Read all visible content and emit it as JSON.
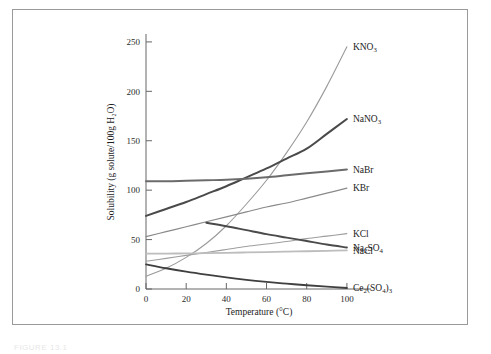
{
  "figure": {
    "caption_partial": "FIGURE 13.1"
  },
  "chart_data": {
    "type": "line",
    "title": "",
    "xlabel": "Temperature (°C)",
    "ylabel": "Solubility (g solute/100g H₂O)",
    "xlim": [
      0,
      112
    ],
    "ylim": [
      0,
      258
    ],
    "xticks": [
      0,
      20,
      40,
      60,
      80,
      100
    ],
    "xtick_labels": [
      "0",
      "20",
      "40",
      "60",
      "80",
      "100"
    ],
    "yticks": [
      0,
      50,
      100,
      150,
      200,
      250
    ],
    "ytick_labels": [
      "0",
      "50",
      "100",
      "150",
      "200",
      "250"
    ],
    "grid": false,
    "legend_position": "right-inline-labels",
    "x": [
      0,
      10,
      20,
      30,
      40,
      50,
      60,
      70,
      80,
      90,
      100
    ],
    "series": [
      {
        "name": "KNO3",
        "label": "KNO",
        "label_sub": "3",
        "color": "#9a9a9a",
        "width": 1.1,
        "label_x": 100,
        "label_y": 245,
        "values": [
          13,
          21,
          32,
          46,
          64,
          86,
          110,
          138,
          169,
          205,
          245
        ]
      },
      {
        "name": "NaNO3",
        "label": "NaNO",
        "label_sub": "3",
        "color": "#4a4a4a",
        "width": 2.0,
        "label_x": 100,
        "label_y": 172,
        "values": [
          74,
          81,
          88,
          96,
          104,
          113,
          122,
          132,
          142,
          157,
          172
        ]
      },
      {
        "name": "NaBr",
        "label": "NaBr",
        "label_sub": "",
        "color": "#6b6b6b",
        "width": 2.0,
        "label_x": 100,
        "label_y": 121,
        "values": [
          109,
          109,
          109.5,
          110,
          110.5,
          111.5,
          113,
          115,
          117,
          119,
          121
        ]
      },
      {
        "name": "KBr",
        "label": "KBr",
        "label_sub": "",
        "color": "#8a8a8a",
        "width": 1.2,
        "label_x": 100,
        "label_y": 102,
        "values": [
          53,
          58,
          63,
          68,
          73,
          78,
          83,
          87,
          92,
          97,
          102
        ]
      },
      {
        "name": "KCl",
        "label": "KCl",
        "label_sub": "",
        "color": "#9e9e9e",
        "width": 1.1,
        "label_x": 100,
        "label_y": 56,
        "values": [
          28,
          31,
          34,
          37,
          40,
          43,
          45.5,
          48,
          51,
          53.5,
          56
        ]
      },
      {
        "name": "NaCl",
        "label": "NaCl",
        "label_sub": "",
        "color": "#bdbdbd",
        "width": 1.8,
        "label_x": 100,
        "label_y": 39,
        "values": [
          35.7,
          35.8,
          36,
          36.2,
          36.5,
          37,
          37.3,
          37.8,
          38.2,
          38.6,
          39
        ]
      },
      {
        "name": "Na2SO4",
        "label": "Na",
        "label_sub": "2",
        "label_tail": "SO",
        "label_sub2": "4",
        "color": "#4a4a4a",
        "width": 1.9,
        "start_x": 30,
        "label_x": 100,
        "label_y": 42,
        "x": [
          30,
          40,
          50,
          60,
          70,
          80,
          90,
          100
        ],
        "values": [
          67,
          63.5,
          59.5,
          55.5,
          52,
          48.5,
          45,
          42
        ]
      },
      {
        "name": "Ce2(SO4)3",
        "label": "Ce",
        "label_sub": "2",
        "label_tail": "(SO",
        "label_sub2": "4",
        "label_tail2": ")",
        "label_sub3": "3",
        "color": "#3f3f3f",
        "width": 1.8,
        "label_x": 100,
        "label_y": 1,
        "values": [
          25,
          21,
          17.5,
          14.5,
          11.8,
          9.3,
          7.2,
          5.4,
          3.8,
          2.4,
          1
        ]
      }
    ]
  }
}
